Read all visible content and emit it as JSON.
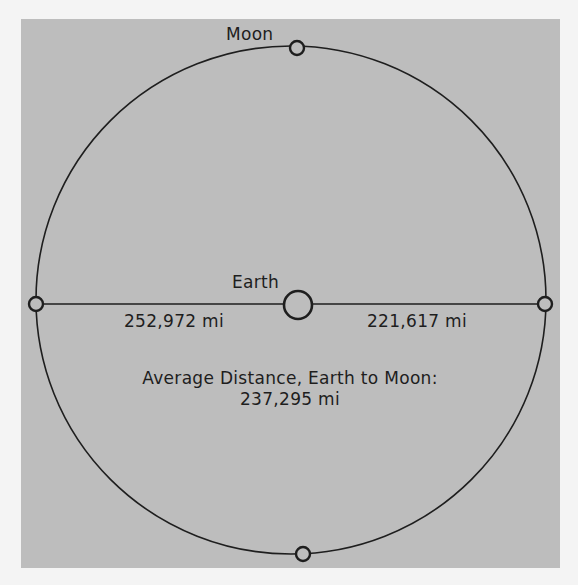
{
  "diagram": {
    "type": "orbit-diagram",
    "colors": {
      "page_background": "#f4f4f4",
      "panel_background": "#bdbdbd",
      "line": "#1e1e1e"
    },
    "labels": {
      "moon": "Moon",
      "earth": "Earth",
      "apogee_distance": "252,972 mi",
      "perigee_distance": "221,617 mi",
      "average_title": "Average Distance, Earth to Moon:",
      "average_value": "237,295 mi"
    },
    "nodes": [
      {
        "name": "moon-top",
        "cx": 297,
        "cy": 48
      },
      {
        "name": "moon-left",
        "cx": 36,
        "cy": 304
      },
      {
        "name": "moon-right",
        "cx": 545,
        "cy": 304
      },
      {
        "name": "moon-bottom",
        "cx": 303,
        "cy": 554
      },
      {
        "name": "earth",
        "cx": 297,
        "cy": 304
      }
    ]
  }
}
